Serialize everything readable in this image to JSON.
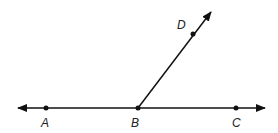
{
  "diagram": {
    "points": [
      {
        "id": "A",
        "label": "A"
      },
      {
        "id": "B",
        "label": "B"
      },
      {
        "id": "C",
        "label": "C"
      },
      {
        "id": "D",
        "label": "D"
      }
    ],
    "lines": [
      {
        "type": "line",
        "through": [
          "A",
          "C"
        ],
        "arrows": "both"
      },
      {
        "type": "ray",
        "from": "B",
        "through": "D"
      }
    ],
    "colors": {
      "stroke": "#111111",
      "background": "#ffffff"
    }
  }
}
